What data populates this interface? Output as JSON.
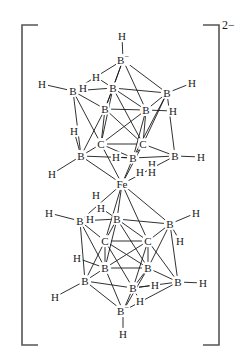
{
  "figure": {
    "kind": "chemical-structure-diagram",
    "name": "bis(dicarbollide) iron complex dianion",
    "overall_charge": "2−",
    "bracket": {
      "left_x": 22,
      "right_x": 219,
      "top_y": 25,
      "bottom_y": 345,
      "arm_length": 16,
      "stroke": "#555555",
      "stroke_width": 1.6
    },
    "colors": {
      "bond": "#1a1a1a",
      "label": "#1a1a1a",
      "bracket": "#555555",
      "background": "#ffffff"
    },
    "atoms": [
      {
        "id": "B_top_apex",
        "element": "B",
        "charge": "−",
        "x": 123,
        "y": 60,
        "text": "B"
      },
      {
        "id": "H_top_apex",
        "element": "H",
        "x": 122,
        "y": 36,
        "text": "H"
      },
      {
        "id": "Bu1",
        "element": "B",
        "x": 73,
        "y": 91,
        "text": "B"
      },
      {
        "id": "Bu2",
        "element": "B",
        "x": 113,
        "y": 88,
        "text": "B"
      },
      {
        "id": "Bu3",
        "element": "B",
        "x": 167,
        "y": 93,
        "text": "B"
      },
      {
        "id": "Bu4",
        "element": "B",
        "x": 105,
        "y": 109,
        "text": "B"
      },
      {
        "id": "Bu5",
        "element": "B",
        "x": 146,
        "y": 110,
        "text": "B"
      },
      {
        "id": "Hu1",
        "element": "H",
        "x": 42,
        "y": 84,
        "text": "H"
      },
      {
        "id": "Hu2",
        "element": "H",
        "x": 96,
        "y": 77,
        "text": "H"
      },
      {
        "id": "Hu3",
        "element": "H",
        "x": 192,
        "y": 83,
        "text": "H"
      },
      {
        "id": "Hu4",
        "element": "H",
        "x": 83,
        "y": 88,
        "text": "H"
      },
      {
        "id": "Hu5",
        "element": "H",
        "x": 173,
        "y": 111,
        "text": "H"
      },
      {
        "id": "Cu1",
        "element": "C",
        "x": 101,
        "y": 144,
        "text": "C"
      },
      {
        "id": "Cu2",
        "element": "C",
        "x": 143,
        "y": 144,
        "text": "C"
      },
      {
        "id": "Bm1",
        "element": "B",
        "x": 81,
        "y": 156,
        "text": "B"
      },
      {
        "id": "Bm2",
        "element": "B",
        "x": 133,
        "y": 158,
        "text": "B"
      },
      {
        "id": "Bm3",
        "element": "B",
        "x": 175,
        "y": 156,
        "text": "B"
      },
      {
        "id": "Hm1",
        "element": "H",
        "x": 74,
        "y": 131,
        "text": "H"
      },
      {
        "id": "Hm2",
        "element": "H",
        "x": 52,
        "y": 174,
        "text": "H"
      },
      {
        "id": "Hm3",
        "element": "H",
        "x": 116,
        "y": 157,
        "text": "H"
      },
      {
        "id": "Hm4",
        "element": "H",
        "x": 152,
        "y": 164,
        "text": "H"
      },
      {
        "id": "Hm5",
        "element": "H",
        "x": 201,
        "y": 157,
        "text": "H"
      },
      {
        "id": "Hm6",
        "element": "H",
        "x": 140,
        "y": 172,
        "text": "H"
      },
      {
        "id": "Fe",
        "element": "Fe",
        "x": 122,
        "y": 184,
        "text": "Fe"
      },
      {
        "id": "Hf1",
        "element": "H",
        "x": 152,
        "y": 172,
        "text": "H"
      },
      {
        "id": "Hf2",
        "element": "H",
        "x": 96,
        "y": 195,
        "text": "H"
      },
      {
        "id": "Bl1",
        "element": "B",
        "x": 80,
        "y": 221,
        "text": "B"
      },
      {
        "id": "Bl2",
        "element": "B",
        "x": 117,
        "y": 219,
        "text": "B"
      },
      {
        "id": "Bl3",
        "element": "B",
        "x": 170,
        "y": 224,
        "text": "B"
      },
      {
        "id": "Hl1",
        "element": "H",
        "x": 49,
        "y": 213,
        "text": "H"
      },
      {
        "id": "Hl2",
        "element": "H",
        "x": 101,
        "y": 208,
        "text": "H"
      },
      {
        "id": "Hl3",
        "element": "H",
        "x": 196,
        "y": 213,
        "text": "H"
      },
      {
        "id": "Hl4",
        "element": "H",
        "x": 90,
        "y": 219,
        "text": "H"
      },
      {
        "id": "Hl5",
        "element": "H",
        "x": 180,
        "y": 241,
        "text": "H"
      },
      {
        "id": "Cl1",
        "element": "C",
        "x": 105,
        "y": 241,
        "text": "C"
      },
      {
        "id": "Cl2",
        "element": "C",
        "x": 148,
        "y": 241,
        "text": "C"
      },
      {
        "id": "Bb1",
        "element": "B",
        "x": 105,
        "y": 268,
        "text": "B"
      },
      {
        "id": "Bb2",
        "element": "B",
        "x": 148,
        "y": 268,
        "text": "B"
      },
      {
        "id": "Bb3",
        "element": "B",
        "x": 85,
        "y": 281,
        "text": "B"
      },
      {
        "id": "Bb4",
        "element": "B",
        "x": 133,
        "y": 288,
        "text": "B"
      },
      {
        "id": "Bb5",
        "element": "B",
        "x": 178,
        "y": 282,
        "text": "B"
      },
      {
        "id": "Hb1",
        "element": "H",
        "x": 77,
        "y": 258,
        "text": "H"
      },
      {
        "id": "Hb2",
        "element": "H",
        "x": 55,
        "y": 297,
        "text": "H"
      },
      {
        "id": "Hb3",
        "element": "H",
        "x": 203,
        "y": 283,
        "text": "H"
      },
      {
        "id": "Hb4",
        "element": "H",
        "x": 155,
        "y": 285,
        "text": "H"
      },
      {
        "id": "Hb5",
        "element": "H",
        "x": 140,
        "y": 301,
        "text": "H"
      },
      {
        "id": "B_bot_apex",
        "element": "B",
        "charge": "−",
        "x": 123,
        "y": 311,
        "text": "B"
      },
      {
        "id": "H_bot_apex",
        "element": "H",
        "x": 123,
        "y": 334,
        "text": "H"
      }
    ],
    "bonds": [
      [
        "H_top_apex",
        "B_top_apex"
      ],
      [
        "B_top_apex",
        "Bu1"
      ],
      [
        "B_top_apex",
        "Bu2"
      ],
      [
        "B_top_apex",
        "Bu3"
      ],
      [
        "B_top_apex",
        "Bu4"
      ],
      [
        "B_top_apex",
        "Bu5"
      ],
      [
        "Bu1",
        "Bu2"
      ],
      [
        "Bu2",
        "Bu3"
      ],
      [
        "Bu1",
        "Bu4"
      ],
      [
        "Bu4",
        "Bu5"
      ],
      [
        "Bu5",
        "Bu3"
      ],
      [
        "Bu2",
        "Bu4"
      ],
      [
        "Bu2",
        "Bu5"
      ],
      [
        "Hu1",
        "Bu1"
      ],
      [
        "Hu2",
        "Bu2"
      ],
      [
        "Hu3",
        "Bu3"
      ],
      [
        "Hu5",
        "Bu5"
      ],
      [
        "Bu1",
        "Bm1"
      ],
      [
        "Bu1",
        "Cu1"
      ],
      [
        "Bu4",
        "Cu1"
      ],
      [
        "Bu4",
        "Bm1"
      ],
      [
        "Bu4",
        "Cu2"
      ],
      [
        "Bu5",
        "Cu2"
      ],
      [
        "Bu5",
        "Bm2"
      ],
      [
        "Bu5",
        "Cu1"
      ],
      [
        "Bu3",
        "Bm3"
      ],
      [
        "Bu3",
        "Cu2"
      ],
      [
        "Bu3",
        "Bm2"
      ],
      [
        "Bu2",
        "Cu1"
      ],
      [
        "Bu2",
        "Cu2"
      ],
      [
        "Cu1",
        "Cu2"
      ],
      [
        "Bm1",
        "Cu1"
      ],
      [
        "Cu1",
        "Bm2"
      ],
      [
        "Cu2",
        "Bm2"
      ],
      [
        "Cu2",
        "Bm3"
      ],
      [
        "Bm1",
        "Bm2"
      ],
      [
        "Bm2",
        "Bm3"
      ],
      [
        "Hm1",
        "Bm1"
      ],
      [
        "Hm2",
        "Bm1"
      ],
      [
        "Hm3",
        "Bm2"
      ],
      [
        "Hm5",
        "Bm3"
      ],
      [
        "Bm1",
        "Fe"
      ],
      [
        "Bm2",
        "Fe"
      ],
      [
        "Bm3",
        "Fe"
      ],
      [
        "Cu1",
        "Fe"
      ],
      [
        "Cu2",
        "Fe"
      ],
      [
        "Fe",
        "Bl1"
      ],
      [
        "Fe",
        "Bl2"
      ],
      [
        "Fe",
        "Bl3"
      ],
      [
        "Fe",
        "Cl1"
      ],
      [
        "Fe",
        "Cl2"
      ],
      [
        "Hl1",
        "Bl1"
      ],
      [
        "Hl2",
        "Bl2"
      ],
      [
        "Hl3",
        "Bl3"
      ],
      [
        "Hl5",
        "Bl3"
      ],
      [
        "Bl1",
        "Bl2"
      ],
      [
        "Bl2",
        "Bl3"
      ],
      [
        "Bl1",
        "Cl1"
      ],
      [
        "Bl2",
        "Cl1"
      ],
      [
        "Bl2",
        "Cl2"
      ],
      [
        "Bl3",
        "Cl2"
      ],
      [
        "Cl1",
        "Cl2"
      ],
      [
        "Bl1",
        "Bb3"
      ],
      [
        "Bl1",
        "Bb1"
      ],
      [
        "Bl2",
        "Bb1"
      ],
      [
        "Bl2",
        "Bb2"
      ],
      [
        "Bl3",
        "Bb5"
      ],
      [
        "Bl3",
        "Bb2"
      ],
      [
        "Cl1",
        "Bb1"
      ],
      [
        "Cl1",
        "Bb3"
      ],
      [
        "Cl1",
        "Bb4"
      ],
      [
        "Cl1",
        "Bb2"
      ],
      [
        "Cl2",
        "Bb2"
      ],
      [
        "Cl2",
        "Bb4"
      ],
      [
        "Cl2",
        "Bb5"
      ],
      [
        "Cl2",
        "Bb1"
      ],
      [
        "Bb1",
        "Bb2"
      ],
      [
        "Bb1",
        "Bb3"
      ],
      [
        "Bb3",
        "Bb4"
      ],
      [
        "Bb4",
        "Bb2"
      ],
      [
        "Bb4",
        "Bb5"
      ],
      [
        "Bb2",
        "Bb5"
      ],
      [
        "Hb1",
        "Bb1"
      ],
      [
        "Hb2",
        "Bb3"
      ],
      [
        "Hb3",
        "Bb5"
      ],
      [
        "Hb4",
        "Bb4"
      ],
      [
        "Hb5",
        "Bb4"
      ],
      [
        "Bb1",
        "B_bot_apex"
      ],
      [
        "Bb2",
        "B_bot_apex"
      ],
      [
        "Bb3",
        "B_bot_apex"
      ],
      [
        "Bb4",
        "B_bot_apex"
      ],
      [
        "Bb5",
        "B_bot_apex"
      ],
      [
        "B_bot_apex",
        "H_bot_apex"
      ]
    ]
  }
}
